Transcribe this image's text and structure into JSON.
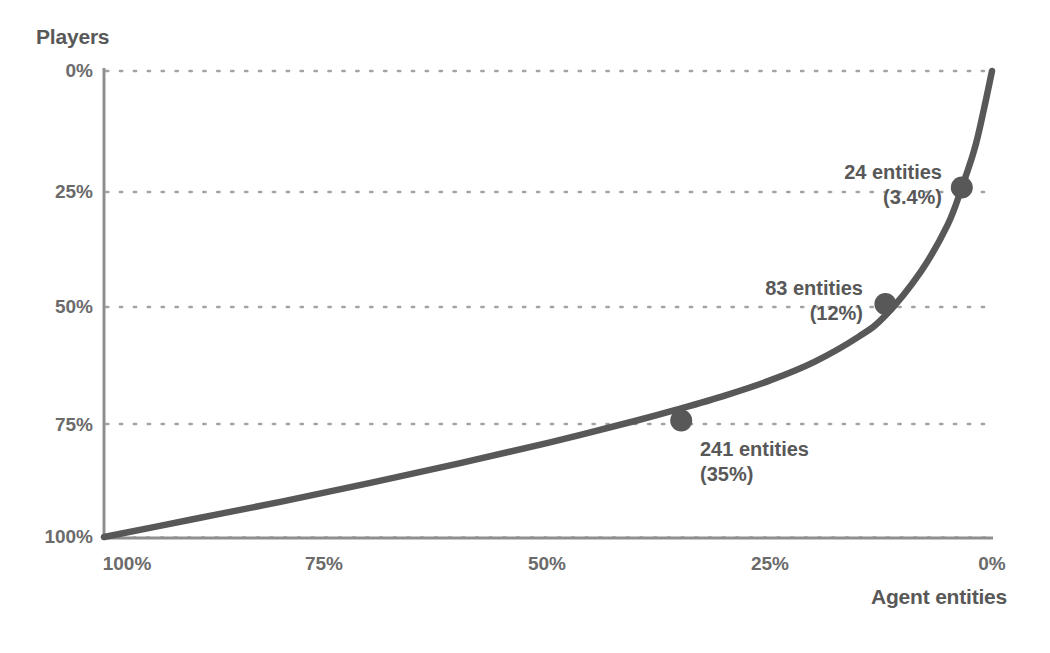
{
  "chart_data": {
    "type": "line",
    "title": "",
    "subtitle": "",
    "xlabel": "Agent entities",
    "ylabel": "Players",
    "x_ticks": [
      "100%",
      "75%",
      "50%",
      "25%",
      "0%"
    ],
    "y_ticks": [
      "0%",
      "25%",
      "50%",
      "75%",
      "100%"
    ],
    "xlim": [
      100,
      0
    ],
    "ylim": [
      100,
      0
    ],
    "x_axis_inverted": true,
    "y_axis_inverted": true,
    "grid": "horizontal-dotted",
    "legend": "none",
    "series": [
      {
        "name": "Cumulative share of players vs agent entities",
        "x": [
          100,
          90,
          80,
          70,
          60,
          50,
          40,
          35,
          30,
          25,
          20,
          15,
          12,
          8,
          5,
          3.4,
          2,
          1,
          0
        ],
        "y": [
          100,
          96.2,
          92.4,
          88.4,
          84.2,
          79.8,
          75.0,
          72.4,
          69.6,
          66.4,
          62.4,
          57.0,
          52.5,
          43.0,
          33.0,
          25.0,
          17.0,
          9.0,
          0
        ]
      }
    ],
    "points": [
      {
        "label": "24 entities",
        "sublabel": "(3.4%)",
        "entities": 24,
        "entities_pct": 3.4,
        "players_pct": 25,
        "align": "right"
      },
      {
        "label": "83 entities",
        "sublabel": "(12%)",
        "entities": 83,
        "entities_pct": 12,
        "players_pct": 50,
        "align": "right"
      },
      {
        "label": "241 entities",
        "sublabel": "(35%)",
        "entities": 241,
        "entities_pct": 35,
        "players_pct": 75,
        "align": "left"
      }
    ],
    "colors": {
      "line": "#585858",
      "marker": "#585858",
      "axis": "#8c8c8c",
      "grid": "#a8a8a8",
      "text": "#5e5e5e",
      "background": "#ffffff"
    }
  },
  "axis_titles": {
    "y": "Players",
    "x": "Agent entities"
  },
  "y_tick_labels": {
    "t0": "0%",
    "t1": "25%",
    "t2": "50%",
    "t3": "75%",
    "t4": "100%"
  },
  "x_tick_labels": {
    "t0": "100%",
    "t1": "75%",
    "t2": "50%",
    "t3": "25%",
    "t4": "0%"
  },
  "annotations": {
    "a0": {
      "main": "24 entities",
      "sub": "(3.4%)"
    },
    "a1": {
      "main": "83 entities",
      "sub": "(12%)"
    },
    "a2": {
      "main": "241 entities",
      "sub": "(35%)"
    }
  }
}
